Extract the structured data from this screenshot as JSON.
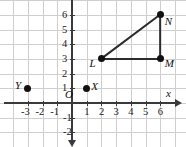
{
  "figure": {
    "type": "coordinate-plane",
    "title": "",
    "background_color": "#ffffff",
    "grid_color": "#cfcfcf",
    "axis_color": "#3a3a3a",
    "point_color": "#111111",
    "segment_color": "#2b2b2b"
  },
  "axes": {
    "x_label": "x",
    "y_label": "",
    "origin_label": "O",
    "x_ticks": [
      "-3",
      "-2",
      "-1",
      "1",
      "2",
      "3",
      "4",
      "5",
      "6"
    ],
    "x_tick_values": [
      -3,
      -2,
      -1,
      1,
      2,
      3,
      4,
      5,
      6
    ],
    "y_ticks": [
      "6",
      "5",
      "4",
      "3",
      "2",
      "1",
      "-1",
      "-2"
    ],
    "y_tick_values": [
      6,
      5,
      4,
      3,
      2,
      1,
      -1,
      -2
    ],
    "xlim": [
      -4,
      6.6
    ],
    "ylim": [
      -2.8,
      6.4
    ],
    "grid": true
  },
  "points": [
    {
      "label": "L",
      "x": 2,
      "y": 3,
      "label_pos": "left"
    },
    {
      "label": "M",
      "x": 6,
      "y": 3,
      "label_pos": "right"
    },
    {
      "label": "N",
      "x": 6,
      "y": 6,
      "label_pos": "right"
    },
    {
      "label": "X",
      "x": 1,
      "y": 1,
      "label_pos": "right"
    },
    {
      "label": "Y",
      "x": -3,
      "y": 1,
      "label_pos": "left"
    }
  ],
  "segments": [
    {
      "from": "L",
      "to": "M"
    },
    {
      "from": "M",
      "to": "N"
    },
    {
      "from": "N",
      "to": "L"
    }
  ],
  "chart_data": {
    "type": "scatter",
    "title": "",
    "xlabel": "x",
    "ylabel": "",
    "xlim": [
      -4,
      6.6
    ],
    "ylim": [
      -2.8,
      6.4
    ],
    "grid": true,
    "series": [
      {
        "name": "triangle LMN",
        "points": [
          {
            "label": "L",
            "x": 2,
            "y": 3
          },
          {
            "label": "M",
            "x": 6,
            "y": 3
          },
          {
            "label": "N",
            "x": 6,
            "y": 6
          }
        ]
      },
      {
        "name": "isolated points",
        "points": [
          {
            "label": "X",
            "x": 1,
            "y": 1
          },
          {
            "label": "Y",
            "x": -3,
            "y": 1
          }
        ]
      }
    ]
  }
}
